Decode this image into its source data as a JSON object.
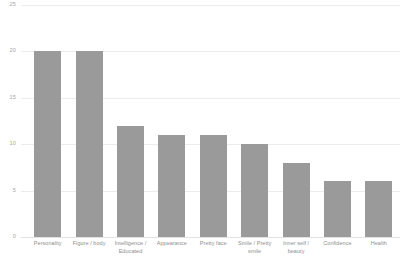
{
  "chart_data": {
    "type": "bar",
    "title": "",
    "subtitle": "",
    "xlabel": "",
    "ylabel": "",
    "categories": [
      "Personality",
      "Figure / body",
      "Intelligence / Educated",
      "Appearance",
      "Pretty face",
      "Smile / Pretty smile",
      "Inner self / beauty",
      "Confidence",
      "Health"
    ],
    "values": [
      20,
      20,
      12,
      11,
      11,
      10,
      8,
      6,
      6
    ],
    "ylim": [
      0,
      25
    ],
    "yticks": [
      0,
      5,
      10,
      15,
      20,
      25
    ],
    "ytick_labels": [
      "0",
      "5",
      "10",
      "15",
      "20",
      "25"
    ],
    "grid": true,
    "grid_axis": "y",
    "legend": false,
    "legend_position": "none",
    "bar_color": "#9a9a9a",
    "gridline_color": "#ececec",
    "tick_label_color": "#a8a8a8",
    "category_label_color": "#8e8e8e",
    "background_color": "#ffffff"
  }
}
